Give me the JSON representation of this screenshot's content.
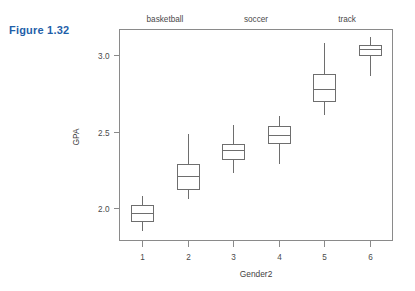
{
  "figure": {
    "label": "Figure 1.32",
    "label_color": "#1f5fa9"
  },
  "chart_data": {
    "type": "box",
    "title": "",
    "subtitle": "",
    "xlabel": "Gender2",
    "ylabel": "GPA",
    "xlim": [
      0.5,
      6.5
    ],
    "ylim": [
      1.79,
      3.17
    ],
    "grid": false,
    "legend_position": "none",
    "x_tick_labels": [
      "1",
      "2",
      "3",
      "4",
      "5",
      "6"
    ],
    "y_tick_labels": [
      "2.0",
      "2.5",
      "3.0"
    ],
    "y_ticks": [
      2.0,
      2.5,
      3.0
    ],
    "group_annotations": [
      {
        "label": "basketball",
        "x_center": 1.5
      },
      {
        "label": "soccer",
        "x_center": 3.5
      },
      {
        "label": "track",
        "x_center": 5.5
      }
    ],
    "categories": [
      "1",
      "2",
      "3",
      "4",
      "5",
      "6"
    ],
    "boxes": [
      {
        "category": "1",
        "whisker_low": 1.86,
        "q1": 1.92,
        "median": 1.97,
        "q3": 2.02,
        "whisker_high": 2.09
      },
      {
        "category": "2",
        "whisker_low": 2.07,
        "q1": 2.13,
        "median": 2.21,
        "q3": 2.29,
        "whisker_high": 2.49
      },
      {
        "category": "3",
        "whisker_low": 2.24,
        "q1": 2.32,
        "median": 2.38,
        "q3": 2.42,
        "whisker_high": 2.55
      },
      {
        "category": "4",
        "whisker_low": 2.3,
        "q1": 2.43,
        "median": 2.48,
        "q3": 2.54,
        "whisker_high": 2.61
      },
      {
        "category": "5",
        "whisker_low": 2.62,
        "q1": 2.7,
        "median": 2.78,
        "q3": 2.88,
        "whisker_high": 3.09
      },
      {
        "category": "6",
        "whisker_low": 2.87,
        "q1": 3.0,
        "median": 3.04,
        "q3": 3.07,
        "whisker_high": 3.13
      }
    ],
    "colors": {
      "box_stroke": "#6e6e6e",
      "box_fill": "#ffffff",
      "axis": "#8a8a8a",
      "text": "#4a4a4a"
    }
  }
}
